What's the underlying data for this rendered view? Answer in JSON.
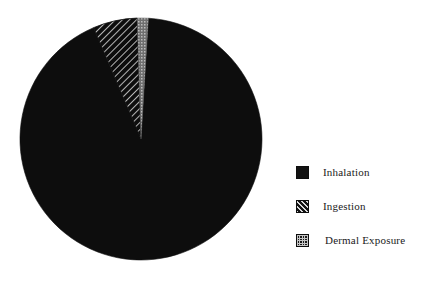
{
  "chart_data": {
    "type": "pie",
    "title": "",
    "subtitle": "",
    "xlabel": "",
    "ylabel": "",
    "grid": false,
    "legend_position": "right",
    "categories": [
      "Inhalation",
      "Ingestion",
      "Dermal Exposure"
    ],
    "values": [
      92.6,
      6.9,
      0.5
    ],
    "units": "percent",
    "slices": [
      {
        "label": "Inhalation",
        "value": 92.6,
        "fill_style": "solid",
        "color": "#0d0d0d",
        "start_angle_deg": 3.5,
        "end_angle_deg": 336.9
      },
      {
        "label": "Ingestion",
        "value": 6.9,
        "fill_style": "diagonal-hatch",
        "color": "#0d0d0d",
        "start_angle_deg": 336.9,
        "end_angle_deg": 358.2
      },
      {
        "label": "Dermal Exposure",
        "value": 0.5,
        "fill_style": "checker-dot",
        "color": "#8a8a8a",
        "start_angle_deg": 358.2,
        "end_angle_deg": 3.5
      }
    ],
    "geometry": {
      "center_x": 141,
      "center_y": 139,
      "radius": 121
    },
    "annotations": []
  },
  "legend": {
    "items": [
      {
        "label": "Inhalation",
        "swatch": "solid-black-swatch"
      },
      {
        "label": "Ingestion",
        "swatch": "hatched-swatch"
      },
      {
        "label": "Dermal Exposure",
        "swatch": "checkered-swatch"
      }
    ]
  },
  "colors": {
    "background": "#ffffff",
    "ink": "#0d0d0d",
    "hatch_line": "#d8d8d8",
    "dermal_light": "#9a9a9a",
    "text": "#1a1a1a"
  }
}
